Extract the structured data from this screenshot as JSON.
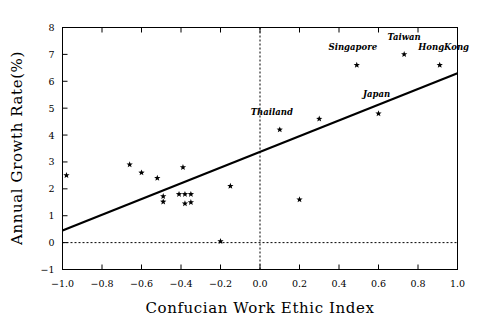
{
  "chart_data": {
    "type": "scatter",
    "title": "",
    "xlabel": "Confucian Work Ethic Index",
    "ylabel": "Annual Growth Rate(%)",
    "xlim": [
      -1.0,
      1.0
    ],
    "ylim": [
      -1,
      8
    ],
    "grid": false,
    "legend": null,
    "xticks": [
      -1.0,
      -0.8,
      -0.6,
      -0.4,
      -0.2,
      0.0,
      0.2,
      0.4,
      0.6,
      0.8,
      1.0
    ],
    "xticklabels": [
      "-1.0",
      "-0.8",
      "-0.6",
      "-0.4",
      "-0.2",
      "0.0",
      "0.2",
      "0.4",
      "0.6",
      "0.8",
      "1.0"
    ],
    "yticks": [
      -1,
      0,
      1,
      2,
      3,
      4,
      5,
      6,
      7,
      8
    ],
    "yticklabels": [
      "-1",
      "0",
      "1",
      "2",
      "3",
      "4",
      "5",
      "6",
      "7",
      "8"
    ],
    "reference_lines": [
      {
        "orientation": "horizontal",
        "value": 0,
        "style": "dashed"
      },
      {
        "orientation": "vertical",
        "value": 0.0,
        "style": "dashed"
      }
    ],
    "fit_line": {
      "style": "solid",
      "x_start": -1.0,
      "y_start": 0.45,
      "x_end": 1.0,
      "y_end": 6.3,
      "slope": 2.925,
      "intercept": 3.375
    },
    "marker": "star",
    "points": [
      {
        "x": -0.98,
        "y": 2.5,
        "label": ""
      },
      {
        "x": -0.66,
        "y": 2.9,
        "label": ""
      },
      {
        "x": -0.6,
        "y": 2.6,
        "label": ""
      },
      {
        "x": -0.52,
        "y": 2.4,
        "label": ""
      },
      {
        "x": -0.49,
        "y": 1.72,
        "label": ""
      },
      {
        "x": -0.49,
        "y": 1.52,
        "label": ""
      },
      {
        "x": -0.41,
        "y": 1.8,
        "label": ""
      },
      {
        "x": -0.39,
        "y": 2.8,
        "label": ""
      },
      {
        "x": -0.38,
        "y": 1.8,
        "label": ""
      },
      {
        "x": -0.38,
        "y": 1.45,
        "label": ""
      },
      {
        "x": -0.35,
        "y": 1.8,
        "label": ""
      },
      {
        "x": -0.35,
        "y": 1.5,
        "label": ""
      },
      {
        "x": -0.2,
        "y": 0.05,
        "label": ""
      },
      {
        "x": -0.15,
        "y": 2.1,
        "label": ""
      },
      {
        "x": 0.1,
        "y": 4.2,
        "label": "Thailand"
      },
      {
        "x": 0.2,
        "y": 1.6,
        "label": ""
      },
      {
        "x": 0.3,
        "y": 4.6,
        "label": ""
      },
      {
        "x": 0.49,
        "y": 6.6,
        "label": "Singapore"
      },
      {
        "x": 0.6,
        "y": 4.8,
        "label": "Japan"
      },
      {
        "x": 0.73,
        "y": 7.0,
        "label": "Taiwan"
      },
      {
        "x": 0.91,
        "y": 6.6,
        "label": "HongKong"
      }
    ],
    "annotations": [
      {
        "text": "Thailand",
        "x": 0.1,
        "y": 4.2,
        "dx": -0.04,
        "dy": 0.55
      },
      {
        "text": "Singapore",
        "x": 0.49,
        "y": 6.6,
        "dx": -0.02,
        "dy": 0.55
      },
      {
        "text": "Japan",
        "x": 0.6,
        "y": 4.8,
        "dx": -0.01,
        "dy": 0.62
      },
      {
        "text": "Taiwan",
        "x": 0.73,
        "y": 7.0,
        "dx": 0.0,
        "dy": 0.55
      },
      {
        "text": "HongKong",
        "x": 0.91,
        "y": 6.6,
        "dx": 0.02,
        "dy": 0.55
      }
    ]
  }
}
